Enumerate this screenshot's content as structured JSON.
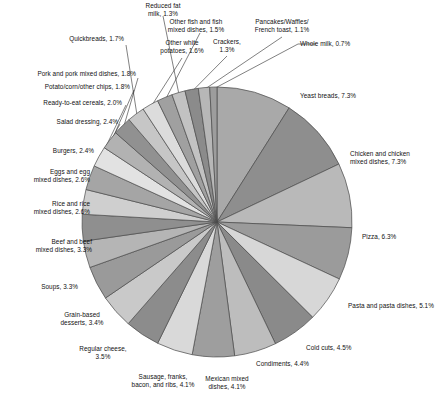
{
  "chart_data": {
    "type": "pie",
    "title": "",
    "xlabel": "",
    "ylabel": "",
    "legend_position": "none",
    "grid": false,
    "start_angle_deg": 0,
    "direction": "clockwise",
    "categories": [
      "Yeast breads",
      "Chicken and chicken mixed dishes",
      "Pizza",
      "Pasta and pasta dishes",
      "Cold cuts",
      "Condiments",
      "Mexican mixed dishes",
      "Sausage, franks, bacon, and ribs",
      "Regular cheese",
      "Grain-based desserts",
      "Soups",
      "Beef and beef mixed dishes",
      "Rice and rice mixed dishes",
      "Eggs and egg mixed dishes",
      "Burgers",
      "Salad dressing",
      "Ready-to-eat cereals",
      "Potato/corn/other chips",
      "Pork and pork mixed dishes",
      "Quickbreads",
      "Other white potatoes",
      "Other fish and fish mixed dishes",
      "Reduced fat milk",
      "Crackers",
      "Pancakes/Waffles/French toast",
      "Whole milk"
    ],
    "values": [
      7.3,
      7.3,
      6.3,
      5.1,
      4.5,
      4.4,
      4.1,
      4.1,
      3.5,
      3.4,
      3.3,
      3.3,
      2.6,
      2.6,
      2.4,
      2.4,
      2.0,
      1.8,
      1.8,
      1.7,
      1.6,
      1.5,
      1.3,
      1.3,
      1.1,
      0.7
    ],
    "colors": [
      "#a9a9a9",
      "#8e8e8e",
      "#b9b9b9",
      "#9b9b9b",
      "#d7d7d7",
      "#8a8a8a",
      "#bdbdbd",
      "#9e9e9e",
      "#d9d9d9",
      "#8c8c8c",
      "#c9c9c9",
      "#9a9a9a",
      "#b5b5b5",
      "#8f8f8f",
      "#cfcfcf",
      "#a5a5a5",
      "#e2e2e2",
      "#b2b2b2",
      "#919191",
      "#c6c6c6",
      "#dcdcdc",
      "#a0a0a0",
      "#c2c2c2",
      "#8b8b8b",
      "#b7b7b7",
      "#9d9d9d"
    ],
    "unit": "%",
    "labels": [
      {
        "id": "yeast-breads",
        "text": "Yeast breads, 7.3%"
      },
      {
        "id": "chicken",
        "text": "Chicken and chicken\nmixed dishes, 7.3%"
      },
      {
        "id": "pizza",
        "text": "Pizza, 6.3%"
      },
      {
        "id": "pasta",
        "text": "Pasta and pasta dishes, 5.1%"
      },
      {
        "id": "cold-cuts",
        "text": "Cold cuts, 4.5%"
      },
      {
        "id": "condiments",
        "text": "Condiments, 4.4%"
      },
      {
        "id": "mexican",
        "text": "Mexican mixed\ndishes, 4.1%"
      },
      {
        "id": "sausage",
        "text": "Sausage, franks,\nbacon, and ribs, 4.1%"
      },
      {
        "id": "regular-cheese",
        "text": "Regular cheese,\n3.5%"
      },
      {
        "id": "grain-desserts",
        "text": "Grain-based\ndesserts, 3.4%"
      },
      {
        "id": "soups",
        "text": "Soups, 3.3%"
      },
      {
        "id": "beef",
        "text": "Beef and beef\nmixed dishes, 3.3%"
      },
      {
        "id": "rice",
        "text": "Rice and rice\nmixed dishes, 2.6%"
      },
      {
        "id": "eggs",
        "text": "Eggs and egg\nmixed dishes, 2.6%"
      },
      {
        "id": "burgers",
        "text": "Burgers, 2.4%"
      },
      {
        "id": "salad-dressing",
        "text": "Salad dressing, 2.4%"
      },
      {
        "id": "rte-cereals",
        "text": "Ready-to-eat cereals, 2.0%"
      },
      {
        "id": "chips",
        "text": "Potato/corn/other chips, 1.8%"
      },
      {
        "id": "pork",
        "text": "Pork and pork mixed dishes, 1.8%"
      },
      {
        "id": "quickbreads",
        "text": "Quickbreads, 1.7%"
      },
      {
        "id": "other-white-potatoes",
        "text": "Other white\npotatoes, 1.6%"
      },
      {
        "id": "other-fish",
        "text": "Other fish and fish\nmixed dishes, 1.5%"
      },
      {
        "id": "reduced-fat-milk",
        "text": "Reduced fat\nmilk, 1.3%"
      },
      {
        "id": "crackers",
        "text": "Crackers,\n1.3%"
      },
      {
        "id": "pancakes",
        "text": "Pancakes/Waffles/\nFrench toast, 1.1%"
      },
      {
        "id": "whole-milk",
        "text": "Whole milk, 0.7%"
      }
    ]
  }
}
